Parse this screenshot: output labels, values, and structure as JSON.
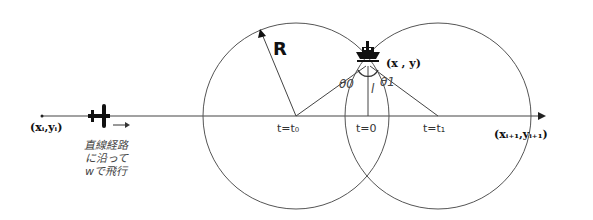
{
  "diagram": {
    "radius_label": "R",
    "ship_position_label": "(x , y)",
    "start_point_label": "(xᵢ,yᵢ)",
    "end_point_label": "(xᵢ₊₁,yᵢ₊₁)",
    "theta0_label": "θ0",
    "theta1_label": "θ1",
    "distance_label": "l",
    "time_labels": {
      "t0": "t=t₀",
      "t_zero": "t=0",
      "t1": "t=t₁"
    },
    "aircraft_note": [
      "直線経路",
      "に沿って",
      "wで飛行"
    ],
    "direction_arrow": "→",
    "colors": {
      "line": "#444444",
      "text": "#222222",
      "background": "#ffffff"
    }
  }
}
